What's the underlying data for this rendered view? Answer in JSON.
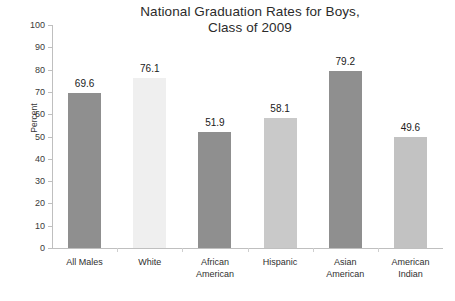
{
  "chart_data": {
    "type": "bar",
    "title": "National Graduation Rates for Boys, Class of 2009",
    "title_lines": [
      "National Graduation Rates for Boys,",
      "Class of 2009"
    ],
    "xlabel": "",
    "ylabel": "Percent",
    "ylim": [
      0,
      100
    ],
    "ytick_step": 10,
    "ytick_labels": [
      "100",
      "90",
      "80",
      "70",
      "60",
      "50",
      "40",
      "30",
      "20",
      "10",
      "0"
    ],
    "grid": false,
    "legend": false,
    "categories": [
      "All Males",
      "White",
      "African American",
      "Hispanic",
      "Asian American",
      "American Indian"
    ],
    "category_lines": [
      [
        "All Males"
      ],
      [
        "White"
      ],
      [
        "African",
        "American"
      ],
      [
        "Hispanic"
      ],
      [
        "Asian",
        "American"
      ],
      [
        "American",
        "Indian"
      ]
    ],
    "values": [
      69.6,
      76.1,
      51.9,
      58.1,
      79.2,
      49.6
    ],
    "value_labels": [
      "69.6",
      "76.1",
      "51.9",
      "58.1",
      "79.2",
      "49.6"
    ],
    "bar_colors": [
      "#8f8f8f",
      "#efefef",
      "#8f8f8f",
      "#c9c9c9",
      "#8f8f8f",
      "#c2c2c2"
    ]
  }
}
